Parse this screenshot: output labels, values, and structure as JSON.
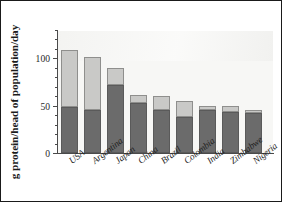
{
  "chart_data": {
    "type": "bar",
    "subtype": "stacked-bar",
    "title": "",
    "xlabel": "",
    "ylabel": "g protein/head of population/day",
    "ylim": [
      0,
      130
    ],
    "yticks": [
      0,
      50,
      100
    ],
    "ytick_labels": [
      "0",
      "50",
      "100"
    ],
    "yminor_step": 10,
    "grid": false,
    "legend": "none",
    "categories": [
      "USA",
      "Argentina",
      "Japan",
      "China",
      "Brazil",
      "Colombia",
      "India",
      "Zimbabwe",
      "Nigeria"
    ],
    "series": [
      {
        "name": "lower segment",
        "color": "#6b6b6b",
        "values": [
          48,
          45,
          72,
          53,
          45,
          38,
          45,
          43,
          42
        ]
      },
      {
        "name": "upper segment",
        "color": "#c9c9c7",
        "values": [
          60,
          56,
          18,
          8,
          15,
          17,
          5,
          6,
          3
        ]
      }
    ],
    "totals": [
      108,
      101,
      90,
      61,
      60,
      55,
      50,
      49,
      45
    ]
  },
  "axis": {
    "y_title": "g protein/head of population/day",
    "tick_0": "0",
    "tick_50": "50",
    "tick_100": "100"
  },
  "labels": {
    "c0": "USA",
    "c1": "Argentina",
    "c2": "Japan",
    "c3": "China",
    "c4": "Brazil",
    "c5": "Colombia",
    "c6": "India",
    "c7": "Zimbabwe",
    "c8": "Nigeria"
  },
  "colors": {
    "panel": "#f7f7f5",
    "bar_lower": "#6b6b6b",
    "bar_upper": "#c9c9c7",
    "bar_edge": "#8f8f8d",
    "axis": "#4a4a4a",
    "text": "#1c1c1c",
    "border": "#1a1a1a"
  }
}
